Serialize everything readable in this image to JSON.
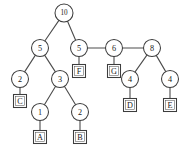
{
  "figure": {
    "width": 190,
    "height": 160,
    "background_color": "#ffffff",
    "stroke_color": "#4c4c4c",
    "node_fill_color": "#ffffff",
    "text_color": "#1a1a1a"
  },
  "tree": {
    "type": "huffman-tree",
    "root_id": "n10",
    "internal_nodes": [
      {
        "id": "n10",
        "label": "10",
        "x": 64,
        "y": 13,
        "r": 9,
        "shape": "circle"
      },
      {
        "id": "n5a",
        "label": "5",
        "x": 40,
        "y": 48,
        "r": 8.5,
        "shape": "circle"
      },
      {
        "id": "n5b",
        "label": "5",
        "x": 79,
        "y": 48,
        "r": 8.5,
        "shape": "circle"
      },
      {
        "id": "n6",
        "label": "6",
        "x": 114,
        "y": 48,
        "r": 8.5,
        "shape": "circle"
      },
      {
        "id": "n8",
        "label": "8",
        "x": 152,
        "y": 48,
        "r": 8.5,
        "shape": "circle"
      },
      {
        "id": "n2a",
        "label": "2",
        "x": 20,
        "y": 79,
        "r": 8.5,
        "shape": "circle"
      },
      {
        "id": "n3",
        "label": "3",
        "x": 60,
        "y": 79,
        "r": 8.5,
        "shape": "circle"
      },
      {
        "id": "n4a",
        "label": "4",
        "x": 130,
        "y": 79,
        "r": 8.5,
        "shape": "circle"
      },
      {
        "id": "n4b",
        "label": "4",
        "x": 170,
        "y": 79,
        "r": 8.5,
        "shape": "circle"
      },
      {
        "id": "n1",
        "label": "1",
        "x": 40,
        "y": 112,
        "r": 8.5,
        "shape": "circle"
      },
      {
        "id": "n2b",
        "label": "2",
        "x": 80,
        "y": 112,
        "r": 8.5,
        "shape": "circle"
      }
    ],
    "leaf_nodes": [
      {
        "id": "lF",
        "label": "F",
        "x": 79,
        "y": 71,
        "size": 13,
        "shape": "square"
      },
      {
        "id": "lG",
        "label": "G",
        "x": 114,
        "y": 71,
        "size": 13,
        "shape": "square"
      },
      {
        "id": "lC",
        "label": "C",
        "x": 20,
        "y": 101,
        "size": 13,
        "shape": "square"
      },
      {
        "id": "lD",
        "label": "D",
        "x": 130,
        "y": 105,
        "size": 13,
        "shape": "square"
      },
      {
        "id": "lE",
        "label": "E",
        "x": 170,
        "y": 105,
        "size": 13,
        "shape": "square"
      },
      {
        "id": "lA",
        "label": "A",
        "x": 40,
        "y": 137,
        "size": 13,
        "shape": "square"
      },
      {
        "id": "lB",
        "label": "B",
        "x": 80,
        "y": 137,
        "size": 13,
        "shape": "square"
      }
    ],
    "edges": [
      {
        "from": "n10",
        "to": "n5a"
      },
      {
        "from": "n10",
        "to": "n5b"
      },
      {
        "from": "n5b",
        "to": "n6"
      },
      {
        "from": "n6",
        "to": "n8"
      },
      {
        "from": "n5b",
        "to": "lF"
      },
      {
        "from": "n6",
        "to": "lG"
      },
      {
        "from": "n5a",
        "to": "n2a"
      },
      {
        "from": "n5a",
        "to": "n3"
      },
      {
        "from": "n2a",
        "to": "lC"
      },
      {
        "from": "n3",
        "to": "n1"
      },
      {
        "from": "n3",
        "to": "n2b"
      },
      {
        "from": "n1",
        "to": "lA"
      },
      {
        "from": "n2b",
        "to": "lB"
      },
      {
        "from": "n8",
        "to": "n4a"
      },
      {
        "from": "n8",
        "to": "n4b"
      },
      {
        "from": "n4a",
        "to": "lD"
      },
      {
        "from": "n4b",
        "to": "lE"
      }
    ]
  }
}
